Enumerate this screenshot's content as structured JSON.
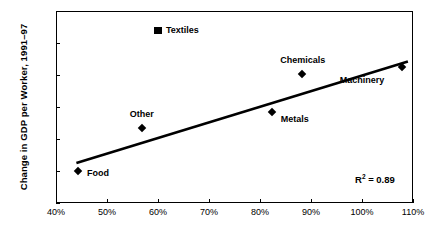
{
  "chart_data": {
    "type": "scatter",
    "title": "",
    "xlabel": "",
    "ylabel": "Change in GDP per Worker, 1991–97",
    "xlim": [
      40,
      110
    ],
    "ylim": [
      0,
      6
    ],
    "xticks": [
      "40%",
      "50%",
      "60%",
      "70%",
      "80%",
      "90%",
      "100%",
      "110%"
    ],
    "xtick_values": [
      40,
      50,
      60,
      70,
      80,
      90,
      100,
      110
    ],
    "yticks": [
      "0%",
      "1%",
      "2%",
      "3%",
      "4%",
      "5%",
      "6%"
    ],
    "ytick_values": [
      0,
      1,
      2,
      3,
      4,
      5,
      6
    ],
    "grid": false,
    "legend": "none",
    "points": [
      {
        "label": "Food",
        "x": 44.5,
        "y": 0.95,
        "marker": "diamond",
        "label_dx": 8,
        "label_dy": -4
      },
      {
        "label": "Other",
        "x": 57.0,
        "y": 2.3,
        "marker": "diamond",
        "label_dx": -13,
        "label_dy": -19
      },
      {
        "label": "Textiles",
        "x": 60.0,
        "y": 5.4,
        "marker": "square",
        "label_dx": 8,
        "label_dy": -4
      },
      {
        "label": "Metals",
        "x": 82.5,
        "y": 2.8,
        "marker": "diamond",
        "label_dx": 8,
        "label_dy": 2
      },
      {
        "label": "Chemicals",
        "x": 88.5,
        "y": 4.0,
        "marker": "diamond",
        "label_dx": -23,
        "label_dy": -19
      },
      {
        "label": "Machinery",
        "x": 108.0,
        "y": 4.2,
        "marker": "diamond",
        "label_dx": -63,
        "label_dy": 7
      }
    ],
    "trendline": {
      "x_start": 44.0,
      "y_start": 1.25,
      "x_end": 109.0,
      "y_end": 4.42
    },
    "annotations": {
      "r_squared_prefix": "R",
      "r_squared_exponent": "2",
      "r_squared_value": " = 0.89"
    },
    "colors": {
      "marker": "#000000",
      "trendline": "#000000",
      "axis": "#000000",
      "background": "#ffffff"
    }
  }
}
